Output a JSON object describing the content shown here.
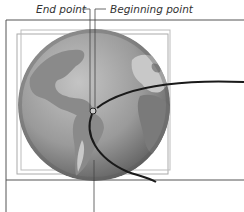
{
  "callouts": {
    "end_point": "End point",
    "beginning_point": "Beginning point"
  },
  "colors": {
    "ocean_light": "#b8b8b8",
    "ocean_dark": "#6a6a6a",
    "land": "#8a8a8a",
    "land_light": "#c8c8c8",
    "path_stroke": "#1a1a1a",
    "frame_stroke": "#555555",
    "bbox_stroke": "#aaaaaa"
  }
}
